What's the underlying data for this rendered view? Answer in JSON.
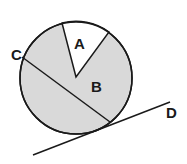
{
  "diagram": {
    "circle": {
      "cx": 76,
      "cy": 78,
      "r": 56,
      "fill": "#d9d9d9",
      "stroke": "#1a1a1a"
    },
    "sector_a": {
      "label": "A",
      "fill": "#ffffff",
      "p1": [
        62,
        23
      ],
      "p2": [
        109,
        32
      ]
    },
    "region_b": {
      "label": "B"
    },
    "chord": {
      "label": "C",
      "from": [
        22,
        57
      ],
      "to": [
        110,
        122
      ]
    },
    "tangent": {
      "label": "D",
      "from": [
        33,
        155
      ],
      "to": [
        170,
        102
      ]
    }
  }
}
